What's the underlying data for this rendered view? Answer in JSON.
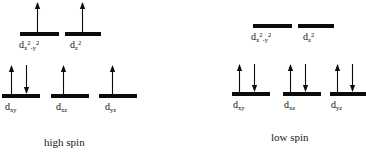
{
  "figure": {
    "background_color": "#ffffff",
    "ink_color": "#0b0b0b"
  },
  "diagrams": [
    {
      "id": "high-spin",
      "caption": "high spin",
      "caption_x": 44,
      "caption_y": 136,
      "levels": [
        {
          "set": "eg",
          "label_html": "d",
          "label_sub": "x",
          "label_sup1": "2",
          "label_mid": "-y",
          "label_sup2": "2",
          "label_text": "dx2-y2",
          "bar_x": 20,
          "bar_y": 32,
          "bar_w": 39,
          "bar_h": 4,
          "label_x": 19,
          "label_y": 40,
          "electrons": [
            {
              "spin": "up",
              "x": 37,
              "top": 2,
              "bottom": 32
            }
          ]
        },
        {
          "set": "eg",
          "label_html": "d",
          "label_sub": "z",
          "label_sup1": "2",
          "label_mid": "",
          "label_sup2": "",
          "label_text": "dz2",
          "bar_x": 65,
          "bar_y": 32,
          "bar_w": 36,
          "bar_h": 4,
          "label_x": 70,
          "label_y": 40,
          "electrons": [
            {
              "spin": "up",
              "x": 82,
              "top": 2,
              "bottom": 32
            }
          ]
        },
        {
          "set": "t2g",
          "label_html": "d",
          "label_sub": "xy",
          "label_sup1": "",
          "label_mid": "",
          "label_sup2": "",
          "label_text": "dxy",
          "bar_x": 2,
          "bar_y": 94,
          "bar_w": 38,
          "bar_h": 4,
          "label_x": 5,
          "label_y": 102,
          "electrons": [
            {
              "spin": "up",
              "x": 11,
              "top": 65,
              "bottom": 94
            },
            {
              "spin": "down",
              "x": 26,
              "top": 65,
              "bottom": 94
            }
          ]
        },
        {
          "set": "t2g",
          "label_html": "d",
          "label_sub": "xz",
          "label_sup1": "",
          "label_mid": "",
          "label_sup2": "",
          "label_text": "dxz",
          "bar_x": 51,
          "bar_y": 94,
          "bar_w": 38,
          "bar_h": 4,
          "label_x": 56,
          "label_y": 102,
          "electrons": [
            {
              "spin": "up",
              "x": 63,
              "top": 65,
              "bottom": 94
            }
          ]
        },
        {
          "set": "t2g",
          "label_html": "d",
          "label_sub": "yz",
          "label_sup1": "",
          "label_mid": "",
          "label_sup2": "",
          "label_text": "dyz",
          "bar_x": 99,
          "bar_y": 94,
          "bar_w": 38,
          "bar_h": 4,
          "label_x": 105,
          "label_y": 102,
          "electrons": [
            {
              "spin": "up",
              "x": 112,
              "top": 65,
              "bottom": 94
            }
          ]
        }
      ]
    },
    {
      "id": "low-spin",
      "caption": "low spin",
      "caption_x": 271,
      "caption_y": 131,
      "levels": [
        {
          "set": "eg",
          "label_html": "d",
          "label_sub": "x",
          "label_sup1": "2",
          "label_mid": "-y",
          "label_sup2": "2",
          "label_text": "dx2-y2",
          "bar_x": 253,
          "bar_y": 24,
          "bar_w": 39,
          "bar_h": 4,
          "label_x": 251,
          "label_y": 32,
          "electrons": []
        },
        {
          "set": "eg",
          "label_html": "d",
          "label_sub": "z",
          "label_sup1": "2",
          "label_mid": "",
          "label_sup2": "",
          "label_text": "dz2",
          "bar_x": 298,
          "bar_y": 24,
          "bar_w": 36,
          "bar_h": 4,
          "label_x": 303,
          "label_y": 32,
          "electrons": []
        },
        {
          "set": "t2g",
          "label_html": "d",
          "label_sub": "xy",
          "label_sup1": "",
          "label_mid": "",
          "label_sup2": "",
          "label_text": "dxy",
          "bar_x": 232,
          "bar_y": 92,
          "bar_w": 38,
          "bar_h": 4,
          "label_x": 233,
          "label_y": 100,
          "electrons": [
            {
              "spin": "up",
              "x": 239,
              "top": 64,
              "bottom": 92
            },
            {
              "spin": "down",
              "x": 254,
              "top": 64,
              "bottom": 92
            }
          ]
        },
        {
          "set": "t2g",
          "label_html": "d",
          "label_sub": "xz",
          "label_sup1": "",
          "label_mid": "",
          "label_sup2": "",
          "label_text": "dxz",
          "bar_x": 283,
          "bar_y": 92,
          "bar_w": 38,
          "bar_h": 4,
          "label_x": 284,
          "label_y": 100,
          "electrons": [
            {
              "spin": "up",
              "x": 290,
              "top": 64,
              "bottom": 92
            },
            {
              "spin": "down",
              "x": 305,
              "top": 64,
              "bottom": 92
            }
          ]
        },
        {
          "set": "t2g",
          "label_html": "d",
          "label_sub": "yz",
          "label_sup1": "",
          "label_mid": "",
          "label_sup2": "",
          "label_text": "dyz",
          "bar_x": 330,
          "bar_y": 92,
          "bar_w": 36,
          "bar_h": 4,
          "label_x": 331,
          "label_y": 100,
          "electrons": [
            {
              "spin": "up",
              "x": 337,
              "top": 64,
              "bottom": 92
            },
            {
              "spin": "down",
              "x": 352,
              "top": 64,
              "bottom": 92
            }
          ]
        }
      ]
    }
  ]
}
